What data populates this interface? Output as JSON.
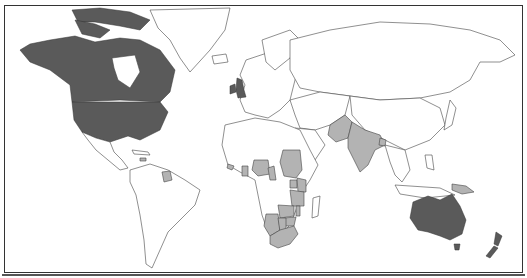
{
  "map": {
    "type": "world-choropleth",
    "projection": "miller-like",
    "frame": true,
    "colors": {
      "dark": "#5a5a5a",
      "light": "#b3b3b3",
      "none": "#ffffff",
      "border": "#444444"
    },
    "categories": [
      {
        "key": "dark",
        "regions": [
          "United States",
          "Canada",
          "United Kingdom",
          "Ireland",
          "Australia",
          "New Zealand"
        ]
      },
      {
        "key": "light",
        "regions": [
          "India",
          "Pakistan",
          "Bangladesh",
          "Nigeria",
          "Ghana",
          "Sierra Leone",
          "Liberia",
          "Gambia",
          "Cameroon",
          "Sudan",
          "Uganda",
          "Kenya",
          "Tanzania",
          "Zambia",
          "Malawi",
          "Zimbabwe",
          "Botswana",
          "Namibia",
          "South Africa",
          "Lesotho",
          "Swaziland",
          "Papua New Guinea",
          "Guyana",
          "Belize",
          "Jamaica"
        ]
      }
    ]
  }
}
